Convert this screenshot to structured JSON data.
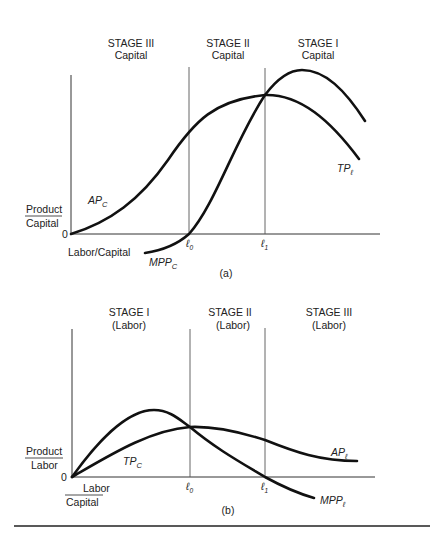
{
  "panel_a": {
    "caption": "(a)",
    "stages": [
      {
        "line1": "STAGE III",
        "line2": "Capital"
      },
      {
        "line1": "STAGE II",
        "line2": "Capital"
      },
      {
        "line1": "STAGE I",
        "line2": "Capital"
      }
    ],
    "y_label_top": "Product",
    "y_label_bottom": "Capital",
    "origin": "0",
    "x_label": "Labor/Capital",
    "markers": {
      "l0_base": "ℓ",
      "l0_sub": "0",
      "l1_base": "ℓ",
      "l1_sub": "1"
    },
    "curves": {
      "ap": {
        "base": "AP",
        "sub": "C"
      },
      "mpp": {
        "base": "MPP",
        "sub": "C"
      },
      "tp": {
        "base": "TP",
        "sub": "ℓ"
      }
    }
  },
  "panel_b": {
    "caption": "(b)",
    "stages": [
      {
        "line1": "STAGE I",
        "line2": "(Labor)"
      },
      {
        "line1": "STAGE II",
        "line2": "(Labor)"
      },
      {
        "line1": "STAGE III",
        "line2": "(Labor)"
      }
    ],
    "y_label_top": "Product",
    "y_label_bottom": "Labor",
    "origin": "0",
    "x_label_top": "Labor",
    "x_label_bottom": "Capital",
    "markers": {
      "l0_base": "ℓ",
      "l0_sub": "0",
      "l1_base": "ℓ",
      "l1_sub": "1"
    },
    "curves": {
      "tp": {
        "base": "TP",
        "sub": "C"
      },
      "ap": {
        "base": "AP",
        "sub": "ℓ"
      },
      "mpp": {
        "base": "MPP",
        "sub": "ℓ"
      }
    }
  },
  "colors": {
    "ink": "#111111",
    "background": "#ffffff"
  }
}
